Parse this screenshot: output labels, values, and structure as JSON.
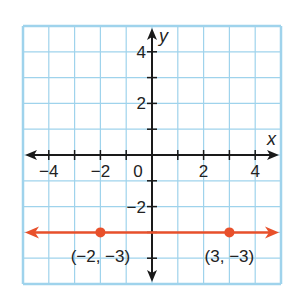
{
  "chart_data": {
    "type": "line",
    "title": "",
    "xlabel": "x",
    "ylabel": "y",
    "xlim": [
      -5,
      5
    ],
    "ylim": [
      -5,
      5
    ],
    "grid": true,
    "x_ticks": [
      -4,
      -2,
      0,
      2,
      4
    ],
    "y_ticks": [
      4,
      2,
      -2
    ],
    "x_tick_labels": [
      "−4",
      "−2",
      "0",
      "2",
      "4"
    ],
    "y_tick_labels": [
      "4",
      "2",
      "−2"
    ],
    "series": [
      {
        "name": "y = -3",
        "equation": "y = -3",
        "color": "#e8502b",
        "points": [
          {
            "x": -2,
            "y": -3,
            "label": "(−2, −3)"
          },
          {
            "x": 3,
            "y": -3,
            "label": "(3, −3)"
          }
        ],
        "arrows_both_ends": true
      }
    ],
    "colors": {
      "grid": "#9fd3ec",
      "axis": "#1a1a1a",
      "line": "#e8502b"
    }
  }
}
